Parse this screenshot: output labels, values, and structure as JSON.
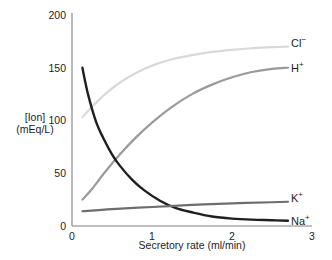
{
  "chart_data": {
    "type": "line",
    "title": "",
    "subtitle": "",
    "xlabel": "Secretory rate (ml/min)",
    "ylabel": "[Ion]\n(mEq/L)",
    "ylabel_line1": "[Ion]",
    "ylabel_line2": "(mEq/L)",
    "xlim": [
      0,
      3
    ],
    "ylim": [
      0,
      200
    ],
    "xticks": [
      "0",
      "1",
      "2",
      "3"
    ],
    "xtick_values": [
      0,
      1,
      2,
      3
    ],
    "yticks": [
      "200",
      "150",
      "100",
      "50",
      "0"
    ],
    "ytick_values": [
      200,
      150,
      100,
      50,
      0
    ],
    "grid": false,
    "legend_position": "right-of-line-ends",
    "annotations": [
      "Cl⁻",
      "H⁺",
      "K⁺",
      "Na⁺"
    ],
    "series": [
      {
        "name": "Cl⁻",
        "label_base": "Cl",
        "label_sup": "−",
        "color": "#d9d9d9",
        "linewidth": 2.2,
        "x": [
          0.13,
          0.25,
          0.4,
          0.6,
          0.8,
          1.0,
          1.25,
          1.5,
          1.75,
          2.0,
          2.25,
          2.5,
          2.7
        ],
        "values": [
          103,
          113,
          124,
          136,
          145,
          152,
          158,
          162,
          165,
          167,
          168.5,
          169.5,
          170
        ]
      },
      {
        "name": "H⁺",
        "label_base": "H",
        "label_sup": "+",
        "color": "#9a9a9a",
        "linewidth": 2.2,
        "x": [
          0.13,
          0.25,
          0.4,
          0.6,
          0.8,
          1.0,
          1.25,
          1.5,
          1.75,
          2.0,
          2.25,
          2.5,
          2.7
        ],
        "values": [
          25,
          35,
          50,
          68,
          84,
          98,
          113,
          125,
          134,
          141,
          146,
          149,
          150
        ]
      },
      {
        "name": "Na⁺",
        "label_base": "Na",
        "label_sup": "+",
        "color": "#1f1f1f",
        "linewidth": 2.4,
        "x": [
          0.13,
          0.2,
          0.3,
          0.4,
          0.5,
          0.6,
          0.75,
          0.9,
          1.1,
          1.3,
          1.5,
          1.75,
          2.0,
          2.25,
          2.5,
          2.7
        ],
        "values": [
          150,
          125,
          99,
          82,
          68,
          57,
          44,
          34,
          24,
          17,
          13,
          9,
          7,
          6,
          5.5,
          5
        ]
      },
      {
        "name": "K⁺",
        "label_base": "K",
        "label_sup": "+",
        "color": "#6e6e6e",
        "linewidth": 2.2,
        "x": [
          0.13,
          0.5,
          1.0,
          1.5,
          2.0,
          2.5,
          2.7
        ],
        "values": [
          14,
          16,
          18,
          20,
          21.5,
          22.5,
          23
        ]
      }
    ]
  },
  "axis": {
    "line_color": "#808080",
    "text_color": "#1c1c1c"
  },
  "series_labels": [
    {
      "base": "Cl",
      "sup": "−"
    },
    {
      "base": "H",
      "sup": "+"
    },
    {
      "base": "K",
      "sup": "+"
    },
    {
      "base": "Na",
      "sup": "+"
    }
  ]
}
